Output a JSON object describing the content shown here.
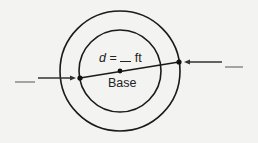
{
  "diagram": {
    "diameter_label": {
      "var": "d",
      "eq": " = ",
      "blank": "__",
      "unit": " ft"
    },
    "center_label": "Base",
    "left_blank": "",
    "right_blank": "",
    "colors": {
      "stroke": "#1a1a1a",
      "background": "#f3f3f1"
    }
  }
}
